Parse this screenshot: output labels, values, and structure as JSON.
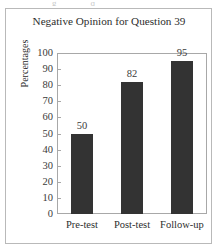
{
  "figure": {
    "background_color": "#ffffff",
    "border_color": "#b9b9b9"
  },
  "chart_data": {
    "type": "bar",
    "title": "Negative Opinion for Question 39",
    "xlabel": "",
    "ylabel": "Percentages",
    "categories": [
      "Pre-test",
      "Post-test",
      "Follow-up"
    ],
    "values": [
      50,
      82,
      95
    ],
    "value_labels": [
      "50",
      "82",
      "95"
    ],
    "ylim": [
      0,
      100
    ],
    "yticks": [
      0,
      10,
      20,
      30,
      40,
      50,
      60,
      70,
      80,
      90,
      100
    ],
    "ytick_labels": [
      "0",
      "10",
      "20",
      "30",
      "40",
      "50",
      "60",
      "70",
      "80",
      "90",
      "100"
    ],
    "grid": false,
    "legend": "none",
    "bar_color": "#333333",
    "axis_color": "#a8a8a8"
  }
}
